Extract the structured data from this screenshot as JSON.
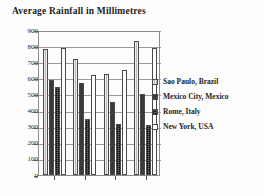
{
  "chart_data": {
    "type": "bar",
    "title": "Average Rainfall in Millimetres",
    "xlabel": "",
    "ylabel": "",
    "ylim": [
      0,
      900
    ],
    "ytick_values": [
      900,
      800,
      700,
      600,
      500,
      400,
      300,
      200,
      100,
      0
    ],
    "ytick_labels": [
      "900",
      "800",
      "700",
      "600",
      "500",
      "400",
      "300",
      "200",
      "100",
      "0"
    ],
    "grid": true,
    "legend_position": "right",
    "categories": [
      "",
      "",
      "",
      ""
    ],
    "series": [
      {
        "name": "Sao Paulo, Brazil",
        "swatch": "light-grey-hatch",
        "color": "#b9b9b9",
        "values": [
          780,
          720,
          625,
          830
        ]
      },
      {
        "name": "Mexico City, Mexico",
        "swatch": "dark-solid",
        "color": "#3a3a3a",
        "values": [
          590,
          570,
          455,
          500
        ]
      },
      {
        "name": "Rome, Italy",
        "swatch": "dark-checker",
        "color": "#6e6e6e",
        "values": [
          545,
          350,
          315,
          310
        ]
      },
      {
        "name": "New York, USA",
        "swatch": "white-empty",
        "color": "#ffffff",
        "values": [
          790,
          620,
          650,
          790
        ]
      }
    ]
  }
}
